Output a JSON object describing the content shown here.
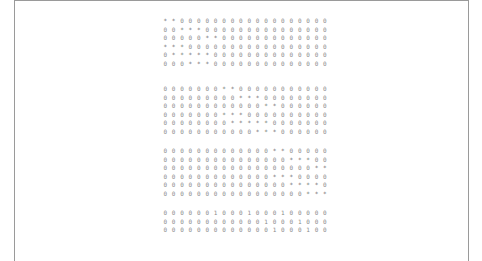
{
  "document": {
    "blocks": [
      {
        "rows": [
          [
            "*",
            "*",
            "0",
            "0",
            "0",
            "0",
            "0",
            "0",
            "0",
            "0",
            "0",
            "0",
            "0",
            "0",
            "0",
            "0",
            "0",
            "0",
            "0",
            "0"
          ],
          [
            "0",
            "0",
            "*",
            "*",
            "*",
            "0",
            "0",
            "0",
            "0",
            "0",
            "0",
            "0",
            "0",
            "0",
            "0",
            "0",
            "0",
            "0",
            "0",
            "0"
          ],
          [
            "0",
            "0",
            "0",
            "0",
            "0",
            "*",
            "*",
            "0",
            "0",
            "0",
            "0",
            "0",
            "0",
            "0",
            "0",
            "0",
            "0",
            "0",
            "0",
            "0"
          ],
          [
            "*",
            "*",
            "*",
            "0",
            "0",
            "0",
            "0",
            "0",
            "0",
            "0",
            "0",
            "0",
            "0",
            "0",
            "0",
            "0",
            "0",
            "0",
            "0",
            "0"
          ],
          [
            "0",
            "*",
            "*",
            "*",
            "*",
            "*",
            "0",
            "0",
            "0",
            "0",
            "0",
            "0",
            "0",
            "0",
            "0",
            "0",
            "0",
            "0",
            "0",
            "0"
          ],
          [
            "0",
            "0",
            "0",
            "*",
            "*",
            "*",
            "0",
            "0",
            "0",
            "0",
            "0",
            "0",
            "0",
            "0",
            "0",
            "0",
            "0",
            "0",
            "0",
            "0"
          ]
        ]
      },
      {
        "rows": [
          [
            "0",
            "0",
            "0",
            "0",
            "0",
            "0",
            "0",
            "*",
            "*",
            "0",
            "0",
            "0",
            "0",
            "0",
            "0",
            "0",
            "0",
            "0",
            "0",
            "0"
          ],
          [
            "0",
            "0",
            "0",
            "0",
            "0",
            "0",
            "0",
            "0",
            "0",
            "*",
            "*",
            "*",
            "0",
            "0",
            "0",
            "0",
            "0",
            "0",
            "0",
            "0"
          ],
          [
            "0",
            "0",
            "0",
            "0",
            "0",
            "0",
            "0",
            "0",
            "0",
            "0",
            "0",
            "0",
            "*",
            "*",
            "0",
            "0",
            "0",
            "0",
            "0",
            "0"
          ],
          [
            "0",
            "0",
            "0",
            "0",
            "0",
            "0",
            "0",
            "*",
            "*",
            "*",
            "0",
            "0",
            "0",
            "0",
            "0",
            "0",
            "0",
            "0",
            "0",
            "0"
          ],
          [
            "0",
            "0",
            "0",
            "0",
            "0",
            "0",
            "0",
            "0",
            "*",
            "*",
            "*",
            "*",
            "*",
            "0",
            "0",
            "0",
            "0",
            "0",
            "0",
            "0"
          ],
          [
            "0",
            "0",
            "0",
            "0",
            "0",
            "0",
            "0",
            "0",
            "0",
            "0",
            "0",
            "*",
            "*",
            "*",
            "0",
            "0",
            "0",
            "0",
            "0",
            "0"
          ]
        ]
      },
      {
        "rows": [
          [
            "0",
            "0",
            "0",
            "0",
            "0",
            "0",
            "0",
            "0",
            "0",
            "0",
            "0",
            "0",
            "0",
            "*",
            "*",
            "0",
            "0",
            "0",
            "0",
            "0"
          ],
          [
            "0",
            "0",
            "0",
            "0",
            "0",
            "0",
            "0",
            "0",
            "0",
            "0",
            "0",
            "0",
            "0",
            "0",
            "0",
            "*",
            "*",
            "*",
            "0",
            "0"
          ],
          [
            "0",
            "0",
            "0",
            "0",
            "0",
            "0",
            "0",
            "0",
            "0",
            "0",
            "0",
            "0",
            "0",
            "0",
            "0",
            "0",
            "0",
            "0",
            "*",
            "*"
          ],
          [
            "0",
            "0",
            "0",
            "0",
            "0",
            "0",
            "0",
            "0",
            "0",
            "0",
            "0",
            "0",
            "0",
            "*",
            "*",
            "*",
            "0",
            "0",
            "0",
            "0"
          ],
          [
            "0",
            "0",
            "0",
            "0",
            "0",
            "0",
            "0",
            "0",
            "0",
            "0",
            "0",
            "0",
            "0",
            "0",
            "0",
            "*",
            "*",
            "*",
            "*",
            "0"
          ],
          [
            "0",
            "0",
            "0",
            "0",
            "0",
            "0",
            "0",
            "0",
            "0",
            "0",
            "0",
            "0",
            "0",
            "0",
            "0",
            "0",
            "0",
            "*",
            "*",
            "*"
          ]
        ]
      },
      {
        "rows": [
          [
            "0",
            "0",
            "0",
            "0",
            "0",
            "0",
            "1",
            "0",
            "0",
            "0",
            "1",
            "0",
            "0",
            "0",
            "1",
            "0",
            "0",
            "0",
            "0",
            "0"
          ],
          [
            "0",
            "0",
            "0",
            "0",
            "0",
            "0",
            "0",
            "0",
            "0",
            "0",
            "0",
            "0",
            "1",
            "0",
            "0",
            "0",
            "1",
            "0",
            "0",
            "0"
          ],
          [
            "0",
            "0",
            "0",
            "0",
            "0",
            "0",
            "0",
            "0",
            "0",
            "0",
            "0",
            "0",
            "0",
            "1",
            "0",
            "0",
            "0",
            "1",
            "0",
            "0"
          ]
        ]
      }
    ]
  }
}
